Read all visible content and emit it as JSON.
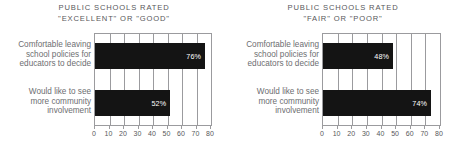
{
  "chart_data": [
    {
      "type": "bar",
      "orientation": "horizontal",
      "title": "PUBLIC SCHOOLS RATED \"EXCELLENT\" OR \"GOOD\"",
      "title_lines": [
        "PUBLIC SCHOOLS RATED",
        "\"EXCELLENT\" OR \"GOOD\""
      ],
      "categories": [
        "Comfortable leaving school policies for educators to decide",
        "Would like to see more community involvement"
      ],
      "category_lines": [
        [
          "Comfortable leaving",
          "school policies for",
          "educators to decide"
        ],
        [
          "Would like to see",
          "more community",
          "involvement"
        ]
      ],
      "values": [
        76,
        52
      ],
      "value_labels": [
        "76%",
        "52%"
      ],
      "xlabel": "",
      "ylabel": "",
      "xlim": [
        0,
        80
      ],
      "xticks": [
        0,
        10,
        20,
        30,
        40,
        50,
        60,
        70,
        80
      ],
      "xtick_labels": [
        "0",
        "10",
        "20",
        "30",
        "40",
        "50",
        "60",
        "70",
        "80"
      ],
      "grid": true,
      "legend": false,
      "bar_color": "#141414",
      "value_label_color": "#ffffff"
    },
    {
      "type": "bar",
      "orientation": "horizontal",
      "title": "PUBLIC SCHOOLS RATED \"FAIR\" OR \"POOR\"",
      "title_lines": [
        "PUBLIC SCHOOLS RATED",
        "\"FAIR\" OR \"POOR\""
      ],
      "categories": [
        "Comfortable leaving school policies for educators to decide",
        "Would like to see more community involvement"
      ],
      "category_lines": [
        [
          "Comfortable leaving",
          "school policies for",
          "educators to decide"
        ],
        [
          "Would like to see",
          "more community",
          "involvement"
        ]
      ],
      "values": [
        48,
        74
      ],
      "value_labels": [
        "48%",
        "74%"
      ],
      "xlabel": "",
      "ylabel": "",
      "xlim": [
        0,
        80
      ],
      "xticks": [
        0,
        10,
        20,
        30,
        40,
        50,
        60,
        70,
        80
      ],
      "xtick_labels": [
        "0",
        "10",
        "20",
        "30",
        "40",
        "50",
        "60",
        "70",
        "80"
      ],
      "grid": true,
      "legend": false,
      "bar_color": "#141414",
      "value_label_color": "#ffffff"
    }
  ],
  "colors": {
    "background": "#ffffff",
    "bar": "#141414",
    "axis": "#9b9b9e",
    "title_text": "#58585b",
    "label_text": "#6d6e71",
    "value_text": "#ffffff"
  }
}
